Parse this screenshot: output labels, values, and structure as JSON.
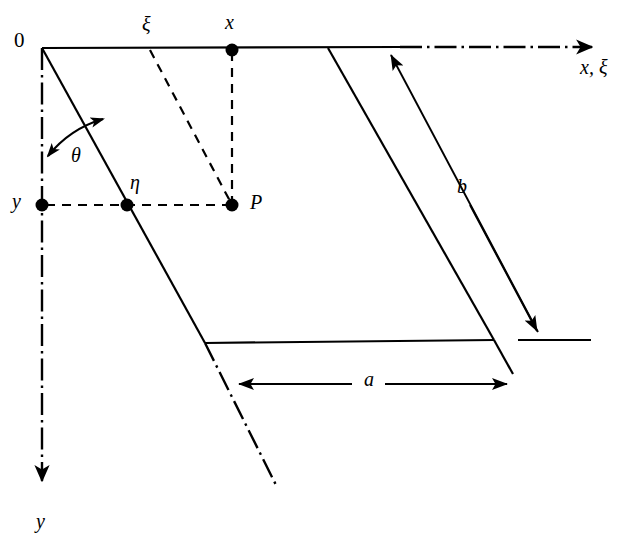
{
  "figure": {
    "type": "geometry-diagram",
    "background_color": "#ffffff",
    "stroke_color": "#000000"
  },
  "labels": {
    "origin": "0",
    "xi_top": "ξ",
    "x_top": "x",
    "axis_x_xi": "x, ξ",
    "theta": "θ",
    "eta": "η",
    "y_left": "y",
    "point_p": "P",
    "y_bottom": "y",
    "dim_b": "b",
    "dim_a": "a"
  },
  "label_positions": {
    "origin": {
      "x": 14,
      "y": 30
    },
    "xi_top": {
      "x": 142,
      "y": 16
    },
    "x_top": {
      "x": 225,
      "y": 14
    },
    "axis_x_xi": {
      "x": 580,
      "y": 58
    },
    "theta": {
      "x": 72,
      "y": 145
    },
    "eta": {
      "x": 130,
      "y": 173
    },
    "y_left": {
      "x": 12,
      "y": 191
    },
    "point_p": {
      "x": 250,
      "y": 192
    },
    "y_bottom": {
      "x": 36,
      "y": 512
    },
    "dim_b": {
      "x": 458,
      "y": 176
    },
    "dim_a": {
      "x": 365,
      "y": 369
    }
  },
  "geometry": {
    "origin": {
      "x": 42,
      "y": 48
    },
    "top_edge": {
      "x1": 42,
      "y1": 48,
      "x2": 400,
      "y2": 47
    },
    "left_slant": {
      "x1": 42,
      "y1": 48,
      "x2": 205,
      "y2": 343
    },
    "bottom_edge": {
      "x1": 205,
      "y1": 343,
      "x2": 494,
      "y2": 340
    },
    "right_slant": {
      "x1": 328,
      "y1": 48,
      "x2": 494,
      "y2": 340
    },
    "x_axis_dashdot": {
      "x1": 400,
      "y1": 47,
      "x2": 598,
      "y2": 47
    },
    "y_axis_dashdot": {
      "x1": 42,
      "y1": 48,
      "x2": 42,
      "y2": 487
    },
    "left_slant_extension_dashdot": {
      "x1": 205,
      "y1": 343,
      "x2": 277,
      "y2": 487
    },
    "right_slant_extension": {
      "x1": 494,
      "y1": 340,
      "x2": 513,
      "y2": 374
    },
    "dashed_p_vertical": {
      "x1": 232,
      "y1": 50,
      "x2": 232,
      "y2": 205
    },
    "dashed_p_horizontal": {
      "x1": 42,
      "y1": 205,
      "x2": 232,
      "y2": 205
    },
    "dashed_xi_slant": {
      "x1": 150,
      "y1": 48,
      "x2": 232,
      "y2": 205
    },
    "dim_b_line": {
      "x1": 387,
      "y1": 48,
      "x2": 538,
      "y2": 332
    },
    "dim_b_tick": {
      "x1": 518,
      "y1": 340,
      "x2": 591,
      "y2": 340
    },
    "dim_a_line": {
      "y": 384,
      "x1": 237,
      "x2": 509
    }
  },
  "points": [
    {
      "name": "x",
      "x": 232,
      "y": 50,
      "radius": 6.5
    },
    {
      "name": "eta",
      "x": 127,
      "y": 205,
      "radius": 6.5
    },
    {
      "name": "y",
      "x": 42,
      "y": 205,
      "radius": 6.5
    },
    {
      "name": "P",
      "x": 232,
      "y": 205,
      "radius": 6.5
    }
  ],
  "line_styles": {
    "solid_width": 2.2,
    "dashdot_pattern": "22 5 2.5 5",
    "dashed_pattern": "9 7",
    "dim_width": 1.8
  }
}
